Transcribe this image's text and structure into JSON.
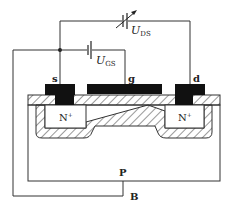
{
  "labels": {
    "source": "s",
    "gate": "g",
    "drain": "d",
    "n_left": "N",
    "n_left_sup": "+",
    "n_right": "N",
    "n_right_sup": "+",
    "substrate": "P",
    "body": "B",
    "uds_main": "U",
    "uds_sub": "DS",
    "ugs_main": "U",
    "ugs_sub": "GS"
  },
  "components": {
    "vds_source": "variable-dc-source",
    "vgs_source": "dc-battery"
  },
  "colors": {
    "line": "#333333",
    "metal": "#111111",
    "hatch": "#333333",
    "background": "#ffffff"
  }
}
